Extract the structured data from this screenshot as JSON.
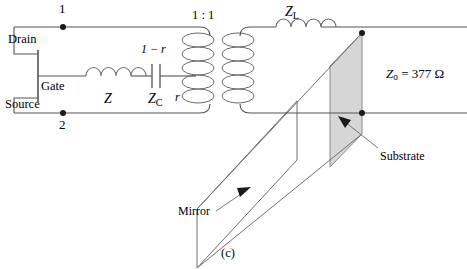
{
  "figure": {
    "caption": "(c)",
    "nodes": {
      "top_label": "1",
      "bottom_label": "2"
    },
    "transistor": {
      "drain_label": "Drain",
      "gate_label": "Gate",
      "source_label": "Source"
    },
    "components": {
      "series_inductor_label": "Z",
      "series_capacitor_label": "Z",
      "series_capacitor_sub": "C",
      "load_inductor_label": "Z",
      "load_inductor_sub": "L"
    },
    "transformer": {
      "ratio_label": "1 : 1",
      "tap_upper_label": "1 − r",
      "tap_lower_label": "r"
    },
    "planes": {
      "substrate_label": "Substrate",
      "mirror_label": "Mirror",
      "substrate_fill": "#d6d6d6",
      "substrate_stroke": "#8a8a8a"
    },
    "impedance": {
      "symbol": "Z",
      "subscript": "o",
      "equals": " = ",
      "value": "377",
      "unit": "Ω"
    },
    "colors": {
      "wire": "#555555",
      "coil": "#6b6b6b",
      "text": "#000000",
      "leader": "#777777"
    }
  }
}
